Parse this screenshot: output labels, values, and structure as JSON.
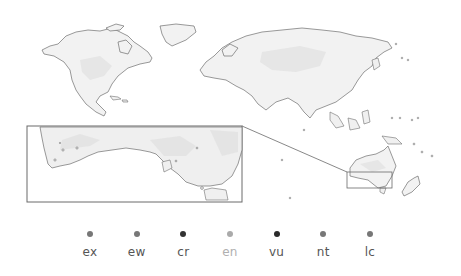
{
  "map": {
    "regions_shown": [
      "North America",
      "Greenland",
      "Europe",
      "Asia",
      "Southeast Asia",
      "Australia",
      "New Zealand"
    ],
    "inset": {
      "subject": "Southern Australia",
      "locator_region": "South-eastern Australia"
    },
    "colors": {
      "land_fill": "#f2f2f2",
      "coastline": "#6e6e6e",
      "frame": "#6a6a6a"
    }
  },
  "legend": {
    "items": [
      {
        "label": "ex",
        "dot_color": "#777777",
        "label_color": "#555555"
      },
      {
        "label": "ew",
        "dot_color": "#777777",
        "label_color": "#555555"
      },
      {
        "label": "cr",
        "dot_color": "#333333",
        "label_color": "#555555"
      },
      {
        "label": "en",
        "dot_color": "#aaaaaa",
        "label_color": "#b0b0b0"
      },
      {
        "label": "vu",
        "dot_color": "#2a2a2a",
        "label_color": "#555555"
      },
      {
        "label": "nt",
        "dot_color": "#777777",
        "label_color": "#555555"
      },
      {
        "label": "lc",
        "dot_color": "#777777",
        "label_color": "#555555"
      }
    ]
  }
}
